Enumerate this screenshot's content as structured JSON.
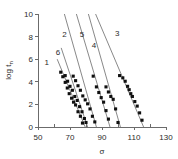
{
  "chart_data": {
    "type": "scatter",
    "title": "",
    "subtitle": "",
    "xlabel": "σ",
    "ylabel": "log tₙ",
    "ylabel_main": "log t",
    "ylabel_sub": "n",
    "xlim": [
      50,
      130
    ],
    "ylim": [
      0,
      10
    ],
    "x_ticks": [
      50,
      70,
      90,
      110,
      130
    ],
    "x_tick_labels": [
      "50",
      "70",
      "90",
      "110",
      "130"
    ],
    "x_minor_ticks": [
      60,
      80,
      100,
      120
    ],
    "y_ticks": [
      0,
      2,
      4,
      6,
      8,
      10
    ],
    "y_tick_labels": [
      "0",
      "2",
      "4",
      "6",
      "8",
      "10"
    ],
    "grid": false,
    "legend": "inline-curve-labels",
    "marker_style": "filled-square",
    "marker_color": "#101010",
    "line_color": "#7a7a7a",
    "axis_color": "#6b6b6b",
    "series": [
      {
        "name": "1",
        "label": "1",
        "label_x": 55.5,
        "label_y": 5.75,
        "fit_line": {
          "x": [
            62.0,
            79.5
          ],
          "y": [
            6.0,
            0.0
          ]
        },
        "x": [
          64.2,
          65.5,
          67.0,
          68.3,
          69.5,
          71.0,
          72.2,
          73.5,
          75.0,
          76.5,
          77.8
        ],
        "y": [
          4.85,
          4.45,
          3.95,
          3.45,
          2.95,
          2.55,
          2.2,
          1.95,
          1.35,
          0.95,
          0.35
        ]
      },
      {
        "name": "6",
        "label": "6",
        "label_x": 62.5,
        "label_y": 6.6,
        "fit_line": {
          "x": [
            64.5,
            81.0
          ],
          "y": [
            7.0,
            0.0
          ]
        },
        "x": [
          67.0,
          68.5,
          70.0,
          71.5,
          73.0,
          74.5,
          76.0,
          77.5,
          79.0,
          80.0
        ],
        "y": [
          4.55,
          4.05,
          3.6,
          3.25,
          2.7,
          2.35,
          1.8,
          1.35,
          0.75,
          0.4
        ]
      },
      {
        "name": "2",
        "label": "2",
        "label_x": 66.5,
        "label_y": 8.25,
        "fit_line": {
          "x": [
            66.5,
            86.5
          ],
          "y": [
            10.0,
            0.0
          ]
        },
        "x": [
          72.0,
          73.5,
          75.0,
          76.5,
          78.0,
          79.5,
          81.0,
          82.5,
          84.0,
          85.5
        ],
        "y": [
          4.5,
          4.1,
          3.65,
          3.25,
          2.75,
          2.4,
          2.05,
          1.6,
          0.95,
          0.45
        ]
      },
      {
        "name": "5",
        "label": "5",
        "label_x": 77.5,
        "label_y": 8.25,
        "fit_line": {
          "x": [
            74.0,
            95.0
          ],
          "y": [
            10.0,
            0.0
          ]
        },
        "x": [
          84.5,
          86.5,
          88.0,
          89.5,
          91.0,
          92.5,
          94.0
        ],
        "y": [
          4.5,
          3.55,
          3.05,
          2.6,
          2.2,
          1.45,
          0.7
        ]
      },
      {
        "name": "4",
        "label": "4",
        "label_x": 85.0,
        "label_y": 7.25,
        "fit_line": {
          "x": [
            81.5,
            101.5
          ],
          "y": [
            10.0,
            0.0
          ]
        },
        "x": [
          92.5,
          94.0,
          95.5,
          97.0,
          98.5,
          100.0
        ],
        "y": [
          3.55,
          3.1,
          2.7,
          2.45,
          1.6,
          0.4
        ]
      },
      {
        "name": "3",
        "label": "3",
        "label_x": 99.5,
        "label_y": 8.3,
        "fit_line": {
          "x": [
            86.0,
            116.0
          ],
          "y": [
            10.0,
            0.0
          ]
        },
        "x": [
          101.0,
          103.0,
          104.5,
          106.0,
          107.0,
          108.0,
          109.0,
          110.5,
          112.0,
          113.5,
          115.0
        ],
        "y": [
          4.55,
          4.35,
          4.05,
          3.6,
          3.3,
          2.95,
          2.7,
          2.25,
          1.85,
          1.25,
          0.6
        ]
      }
    ]
  }
}
